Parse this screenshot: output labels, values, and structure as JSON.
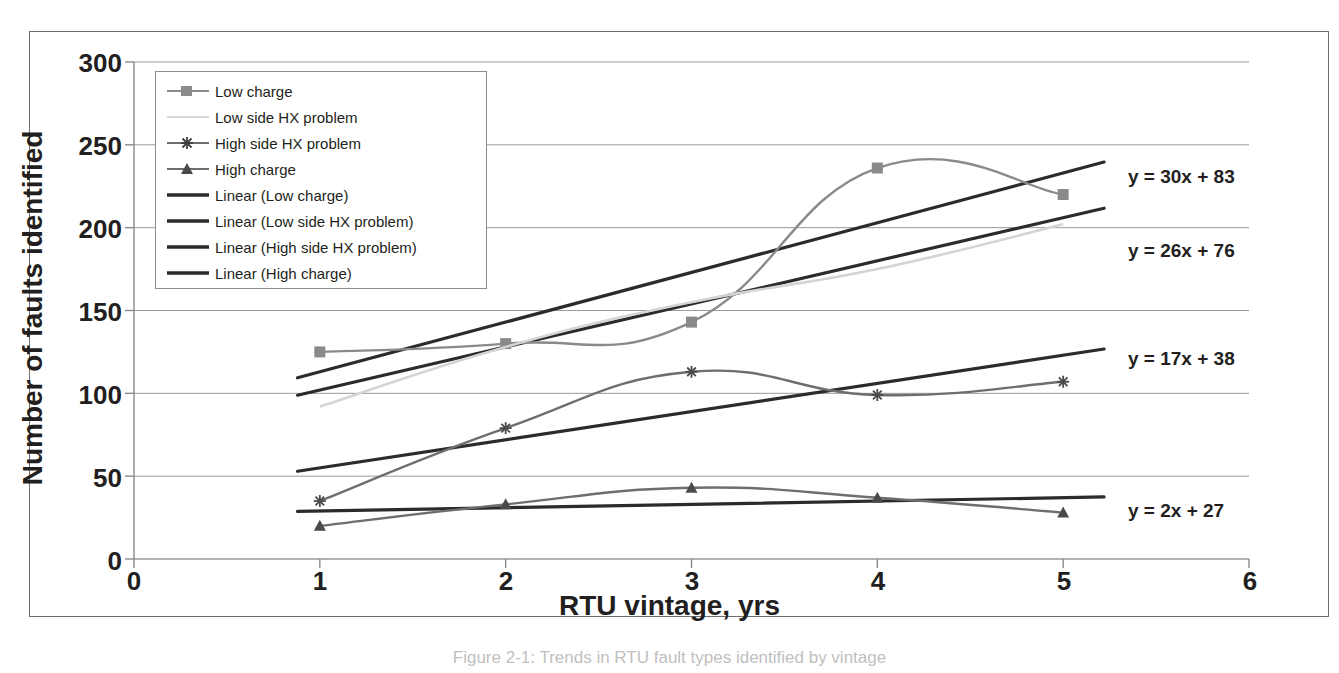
{
  "figure": {
    "caption": "Figure 2-1: Trends in RTU fault types identified by vintage"
  },
  "chart_data": {
    "type": "line",
    "title": "",
    "xlabel": "RTU vintage, yrs",
    "ylabel": "Number of faults identified",
    "x": [
      1,
      2,
      3,
      4,
      5
    ],
    "xlim": [
      0,
      6
    ],
    "ylim": [
      0,
      300
    ],
    "xticks": [
      "0",
      "1",
      "2",
      "3",
      "4",
      "5",
      "6"
    ],
    "yticks": [
      "0",
      "50",
      "100",
      "150",
      "200",
      "250",
      "300"
    ],
    "grid": "horizontal",
    "legend_position": "upper-left-inside",
    "series": [
      {
        "name": "Low charge",
        "marker": "square",
        "color": "#8a8a8a",
        "values": [
          125,
          130,
          143,
          236,
          220
        ]
      },
      {
        "name": "Low side HX problem",
        "marker": "none",
        "color": "#d4d4d4",
        "values": [
          92,
          128,
          155,
          175,
          202
        ]
      },
      {
        "name": "High side HX problem",
        "marker": "star",
        "color": "#6e6e6e",
        "values": [
          35,
          79,
          113,
          99,
          107
        ]
      },
      {
        "name": "High charge",
        "marker": "triangle",
        "color": "#6e6e6e",
        "values": [
          20,
          33,
          43,
          37,
          28
        ]
      }
    ],
    "trendlines": [
      {
        "name": "Linear (Low charge)",
        "equation": "y = 30x + 83",
        "slope": 30,
        "intercept": 83,
        "color": "#2b2b2b"
      },
      {
        "name": "Linear (Low side HX problem)",
        "equation": "y = 26x + 76",
        "slope": 26,
        "intercept": 76,
        "color": "#2b2b2b"
      },
      {
        "name": "Linear (High side HX problem)",
        "equation": "y = 17x + 38",
        "slope": 17,
        "intercept": 38,
        "color": "#2b2b2b"
      },
      {
        "name": "Linear (High charge)",
        "equation": "y = 2x + 27",
        "slope": 2,
        "intercept": 27,
        "color": "#2b2b2b"
      }
    ],
    "legend": [
      "Low charge",
      "Low side HX problem",
      "High side HX problem",
      "High charge",
      "Linear (Low charge)",
      "Linear (Low side HX problem)",
      "Linear (High side HX problem)",
      "Linear (High charge)"
    ],
    "annotations": [
      {
        "text": "y = 30x + 83",
        "x": 5.2,
        "y": 230
      },
      {
        "text": "y = 26x + 76",
        "x": 5.2,
        "y": 185
      },
      {
        "text": "y = 17x + 38",
        "x": 5.2,
        "y": 120
      },
      {
        "text": "y = 2x + 27",
        "x": 5.2,
        "y": 35
      }
    ]
  }
}
